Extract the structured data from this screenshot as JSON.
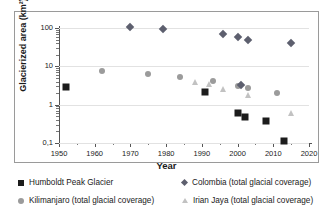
{
  "chart_data": {
    "type": "scatter",
    "title": "",
    "xlabel": "Year",
    "ylabel": "Glacierized area (km²)",
    "yscale": "log",
    "xlim": [
      1950,
      2020
    ],
    "ylim": [
      0.1,
      100
    ],
    "grid": true,
    "legend_position": "bottom",
    "xticks": [
      1950,
      1960,
      1970,
      1980,
      1990,
      2000,
      2010,
      2020
    ],
    "xtick_labels": [
      "1950",
      "1960",
      "1970",
      "1980",
      "1990",
      "2000",
      "2010",
      "2020"
    ],
    "xminor_ticks": [
      1955,
      1965,
      1975,
      1985,
      1995,
      2005,
      2015
    ],
    "yticks": [
      0.1,
      1,
      10,
      100
    ],
    "ytick_labels": [
      "0,1",
      "1",
      "10",
      "100"
    ],
    "series": [
      {
        "name": "Humboldt Peak Glacier",
        "marker": "square",
        "color": "#1c1c1c",
        "points": [
          {
            "x": 1952,
            "y": 2.9
          },
          {
            "x": 1991,
            "y": 2.2
          },
          {
            "x": 2000,
            "y": 0.6
          },
          {
            "x": 2002,
            "y": 0.47
          },
          {
            "x": 2008,
            "y": 0.37
          },
          {
            "x": 2013,
            "y": 0.11
          }
        ]
      },
      {
        "name": "Kilimanjaro (total glacial coverage)",
        "marker": "circle",
        "color": "#9b9b9b",
        "points": [
          {
            "x": 1962,
            "y": 7.5
          },
          {
            "x": 1975,
            "y": 6.2
          },
          {
            "x": 1984,
            "y": 5.2
          },
          {
            "x": 1993,
            "y": 4.2
          },
          {
            "x": 2000,
            "y": 3.1
          },
          {
            "x": 2003,
            "y": 2.7
          },
          {
            "x": 2011,
            "y": 2.0
          }
        ]
      },
      {
        "name": "Colombia (total glacial coverage)",
        "marker": "diamond",
        "color": "#5d5f6e",
        "points": [
          {
            "x": 1970,
            "y": 108
          },
          {
            "x": 1979,
            "y": 97
          },
          {
            "x": 1996,
            "y": 70
          },
          {
            "x": 2000,
            "y": 60
          },
          {
            "x": 2003,
            "y": 50
          },
          {
            "x": 2015,
            "y": 40
          },
          {
            "x": 2001,
            "y": 3.3
          }
        ]
      },
      {
        "name": "Irian Jaya (total glacial coverage)",
        "marker": "triangle",
        "color": "#c2c2c2",
        "points": [
          {
            "x": 1988,
            "y": 3.9
          },
          {
            "x": 1992,
            "y": 3.4
          },
          {
            "x": 1996,
            "y": 2.5
          },
          {
            "x": 2003,
            "y": 1.8
          },
          {
            "x": 2015,
            "y": 0.62
          }
        ]
      }
    ]
  },
  "legend": {
    "items": [
      {
        "label": "Humboldt Peak Glacier",
        "marker": "square-marker"
      },
      {
        "label": "Kilimanjaro (total glacial coverage)",
        "marker": "circle-marker"
      },
      {
        "label": "Colombia (total glacial coverage)",
        "marker": "diamond-marker"
      },
      {
        "label": "Irian Jaya (total glacial coverage)",
        "marker": "triangle-marker"
      }
    ]
  }
}
